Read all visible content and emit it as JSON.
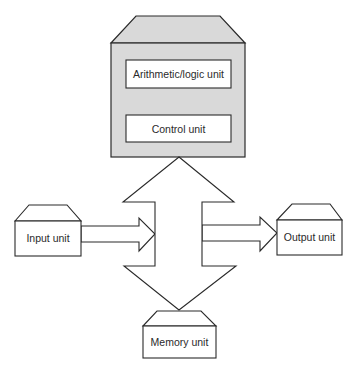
{
  "diagram": {
    "type": "computer-architecture-block-diagram",
    "cpu": {
      "components": [
        {
          "id": "alu",
          "label": "Arithmetic/logic unit"
        },
        {
          "id": "control",
          "label": "Control unit"
        }
      ],
      "fill_color": "#d9d9d9"
    },
    "units": {
      "input": {
        "label": "Input unit"
      },
      "output": {
        "label": "Output unit"
      },
      "memory": {
        "label": "Memory unit"
      }
    },
    "connections": [
      {
        "from": "input",
        "to": "bus",
        "type": "one-way-arrow"
      },
      {
        "from": "bus",
        "to": "output",
        "type": "one-way-arrow"
      },
      {
        "from": "cpu",
        "to": "memory",
        "type": "two-way-arrow"
      }
    ],
    "line_color": "#2a2a2a"
  }
}
